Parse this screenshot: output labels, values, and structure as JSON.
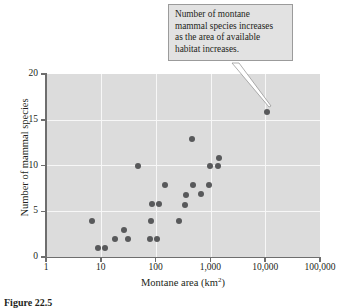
{
  "figure": {
    "caption": "Figure 22.5",
    "callout": {
      "lines": [
        "Number of montane",
        "mammal species increases",
        "as the area of available",
        "habitat increases."
      ]
    }
  },
  "chart_data": {
    "type": "scatter",
    "title": "",
    "xlabel": "Montane area (km",
    "xlabel_sup": "2",
    "xlabel_suffix": ")",
    "ylabel": "Number of mammal species",
    "xscale": "log",
    "yscale": "linear",
    "xlim": [
      1,
      100000
    ],
    "ylim": [
      0,
      20
    ],
    "grid": true,
    "legend": "none",
    "xticks": [
      1,
      10,
      100,
      1000,
      10000,
      100000
    ],
    "xticklabels": [
      "1",
      "10",
      "100",
      "1,000",
      "10,000",
      "100,000"
    ],
    "yticks": [
      0,
      5,
      10,
      15,
      20
    ],
    "yticklabels": [
      "0",
      "5",
      "10",
      "15",
      "20"
    ],
    "marker_color": "#58595b",
    "plot_background": "#dcdcdc",
    "gridline_color": "#f7f7f7",
    "points": [
      {
        "x": 7,
        "y": 3.9
      },
      {
        "x": 9,
        "y": 1.0
      },
      {
        "x": 12,
        "y": 1.0
      },
      {
        "x": 18,
        "y": 2.0
      },
      {
        "x": 26,
        "y": 2.9
      },
      {
        "x": 31,
        "y": 2.0
      },
      {
        "x": 48,
        "y": 10.0
      },
      {
        "x": 78,
        "y": 2.0
      },
      {
        "x": 82,
        "y": 3.9
      },
      {
        "x": 86,
        "y": 5.8
      },
      {
        "x": 108,
        "y": 2.0
      },
      {
        "x": 115,
        "y": 5.8
      },
      {
        "x": 148,
        "y": 7.9
      },
      {
        "x": 270,
        "y": 3.9
      },
      {
        "x": 350,
        "y": 5.7
      },
      {
        "x": 360,
        "y": 6.8
      },
      {
        "x": 470,
        "y": 12.9
      },
      {
        "x": 490,
        "y": 7.9
      },
      {
        "x": 660,
        "y": 6.9
      },
      {
        "x": 950,
        "y": 7.9
      },
      {
        "x": 980,
        "y": 9.9
      },
      {
        "x": 1400,
        "y": 9.9
      },
      {
        "x": 1450,
        "y": 10.8
      },
      {
        "x": 11000,
        "y": 15.8
      }
    ],
    "annotated_point": {
      "x": 11000,
      "y": 15.8
    }
  }
}
